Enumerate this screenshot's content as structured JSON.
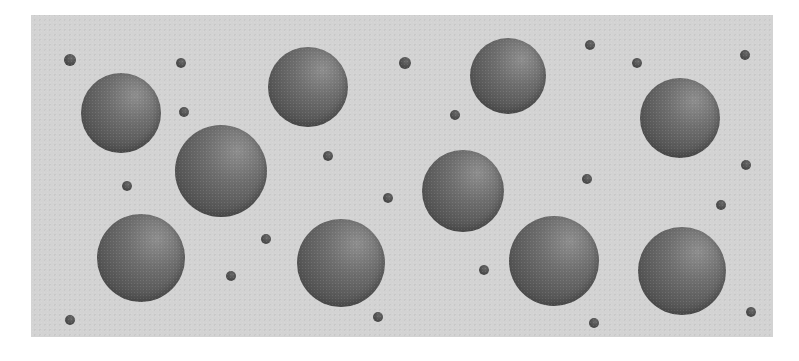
{
  "scene": {
    "description": "Large and small shaded gray spheres scattered on a light gray textured panel",
    "colors": {
      "page_background": "#ffffff",
      "panel_background": "#d3d3d3",
      "sphere_highlight": "#8e8e8e",
      "sphere_shadow": "#4a4a4a",
      "dot_color": "#4a4a4a"
    },
    "panel": {
      "x": 31,
      "y": 15,
      "width": 742,
      "height": 322
    },
    "large_spheres": [
      {
        "cx": 121,
        "cy": 113,
        "r": 40
      },
      {
        "cx": 308,
        "cy": 87,
        "r": 40
      },
      {
        "cx": 508,
        "cy": 76,
        "r": 38
      },
      {
        "cx": 680,
        "cy": 118,
        "r": 40
      },
      {
        "cx": 221,
        "cy": 171,
        "r": 46
      },
      {
        "cx": 463,
        "cy": 191,
        "r": 41
      },
      {
        "cx": 141,
        "cy": 258,
        "r": 44
      },
      {
        "cx": 341,
        "cy": 263,
        "r": 44
      },
      {
        "cx": 554,
        "cy": 261,
        "r": 45
      },
      {
        "cx": 682,
        "cy": 271,
        "r": 44
      }
    ],
    "small_dots": [
      {
        "cx": 70,
        "cy": 60,
        "r": 6
      },
      {
        "cx": 181,
        "cy": 63,
        "r": 5
      },
      {
        "cx": 184,
        "cy": 112,
        "r": 5
      },
      {
        "cx": 405,
        "cy": 63,
        "r": 6
      },
      {
        "cx": 590,
        "cy": 45,
        "r": 5
      },
      {
        "cx": 637,
        "cy": 63,
        "r": 5
      },
      {
        "cx": 745,
        "cy": 55,
        "r": 5
      },
      {
        "cx": 455,
        "cy": 115,
        "r": 5
      },
      {
        "cx": 328,
        "cy": 156,
        "r": 5
      },
      {
        "cx": 127,
        "cy": 186,
        "r": 5
      },
      {
        "cx": 388,
        "cy": 198,
        "r": 5
      },
      {
        "cx": 587,
        "cy": 179,
        "r": 5
      },
      {
        "cx": 746,
        "cy": 165,
        "r": 5
      },
      {
        "cx": 721,
        "cy": 205,
        "r": 5
      },
      {
        "cx": 266,
        "cy": 239,
        "r": 5
      },
      {
        "cx": 231,
        "cy": 276,
        "r": 5
      },
      {
        "cx": 484,
        "cy": 270,
        "r": 5
      },
      {
        "cx": 70,
        "cy": 320,
        "r": 5
      },
      {
        "cx": 378,
        "cy": 317,
        "r": 5
      },
      {
        "cx": 594,
        "cy": 323,
        "r": 5
      },
      {
        "cx": 751,
        "cy": 312,
        "r": 5
      }
    ]
  }
}
